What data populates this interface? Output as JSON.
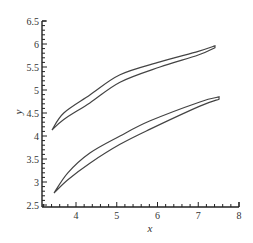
{
  "chart_data": {
    "type": "line",
    "title": "",
    "xlabel": "x",
    "ylabel": "y",
    "xlim": [
      3.17,
      8
    ],
    "ylim": [
      2.5,
      6.5
    ],
    "grid": false,
    "legend": null,
    "x_ticks": [
      "4",
      "5",
      "6",
      "7",
      "8"
    ],
    "y_ticks": [
      "2.5",
      "3",
      "3.5",
      "4",
      "4.5",
      "5",
      "5.5",
      "6",
      "6.5"
    ],
    "series": [
      {
        "name": "upper-profile",
        "closed": true,
        "upper_surface": {
          "x": [
            3.41,
            3.7,
            4.34,
            5.08,
            6.06,
            7.0,
            7.41
          ],
          "y": [
            4.13,
            4.5,
            4.89,
            5.33,
            5.61,
            5.84,
            5.96
          ]
        },
        "lower_surface": {
          "x": [
            3.41,
            3.7,
            4.34,
            5.08,
            6.06,
            7.0,
            7.41
          ],
          "y": [
            4.13,
            4.36,
            4.72,
            5.17,
            5.5,
            5.76,
            5.92
          ]
        }
      },
      {
        "name": "lower-profile",
        "closed": true,
        "upper_surface": {
          "x": [
            3.46,
            3.8,
            4.34,
            5.08,
            5.82,
            7.04,
            7.51
          ],
          "y": [
            2.76,
            3.2,
            3.63,
            4.0,
            4.33,
            4.74,
            4.85
          ]
        },
        "lower_surface": {
          "x": [
            3.46,
            3.8,
            4.34,
            5.08,
            5.82,
            7.04,
            7.51
          ],
          "y": [
            2.76,
            3.05,
            3.41,
            3.82,
            4.15,
            4.65,
            4.8
          ]
        }
      }
    ]
  },
  "labels": {
    "x_axis": "x",
    "y_axis": "y"
  },
  "colors": {
    "line": "#444444",
    "axis": "#222222"
  }
}
